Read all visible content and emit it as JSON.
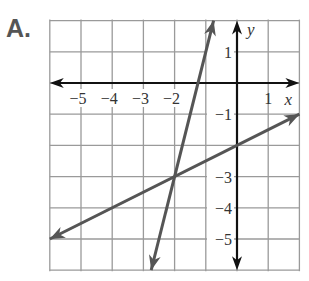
{
  "label": "A.",
  "chart_data": {
    "type": "line",
    "title": "A.",
    "xlabel": "x",
    "ylabel": "y",
    "xlim": [
      -6,
      2
    ],
    "ylim": [
      -6,
      2
    ],
    "grid": true,
    "x_tick_labels": [
      "−5",
      "−4",
      "−3",
      "−2",
      "1"
    ],
    "y_tick_labels": [
      "1",
      "−1",
      "3",
      "4",
      "5"
    ],
    "series": [
      {
        "name": "steep line",
        "equation": "y = 4x + 5",
        "points": [
          [
            -2.75,
            -6
          ],
          [
            -2,
            -3
          ],
          [
            -1.25,
            0
          ],
          [
            -0.75,
            2
          ]
        ]
      },
      {
        "name": "shallow line",
        "equation": "y = 0.5x - 2",
        "points": [
          [
            -6,
            -5
          ],
          [
            -2,
            -3
          ],
          [
            0,
            -2
          ],
          [
            2,
            -1
          ]
        ]
      }
    ],
    "intersection": [
      -2,
      -3
    ],
    "colors": {
      "lines": "#555555",
      "axes": "#111111",
      "grid": "#999999"
    }
  }
}
